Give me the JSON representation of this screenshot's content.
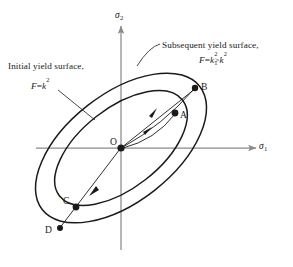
{
  "figure": {
    "background_color": "#ffffff",
    "line_color": "#1a1a1a",
    "axis_color": "#8a8a8a",
    "axes": {
      "vertical": {
        "name": "sigma-2",
        "base_symbol": "σ",
        "subscript": "2"
      },
      "horizontal": {
        "name": "sigma-1",
        "base_symbol": "σ",
        "subscript": "1"
      }
    },
    "annotations": {
      "initial": {
        "caption": "Initial yield surface,",
        "formula_lhs": "F",
        "formula_eq": "=",
        "formula_rhs_base": "k",
        "formula_rhs_sup": "2",
        "formula_plain": "F = k2"
      },
      "subsequent": {
        "caption": "Subsequent yield surface,",
        "formula_lhs": "F",
        "formula_eq": "=",
        "formula_rhs_base": "k",
        "formula_rhs_sup": "2",
        "formula_rhs_sub": "1",
        "formula_relation": ">",
        "formula_second_base": "k",
        "formula_second_sup": "2",
        "formula_plain": "F = k1^2 > k^2"
      }
    },
    "points": [
      {
        "name": "origin",
        "label": "O",
        "x": 121,
        "y": 148,
        "marked": true
      },
      {
        "name": "point-a",
        "label": "A",
        "x": 175,
        "y": 113,
        "marked": true
      },
      {
        "name": "point-b",
        "label": "B",
        "x": 195,
        "y": 88,
        "marked": true
      },
      {
        "name": "point-c",
        "label": "C",
        "x": 76,
        "y": 207,
        "marked": true
      },
      {
        "name": "point-d",
        "label": "D",
        "x": 60,
        "y": 228,
        "marked": true
      }
    ],
    "curves": [
      {
        "name": "initial-yield-surface",
        "type": "ellipse",
        "rx": 78,
        "ry": 40,
        "cx": 121,
        "cy": 148,
        "rotation_deg": -38
      },
      {
        "name": "subsequent-yield-surface",
        "type": "ellipse",
        "rx": 100,
        "ry": 54,
        "cx": 121,
        "cy": 148,
        "rotation_deg": -38
      }
    ],
    "paths": [
      {
        "name": "loading-path-upper",
        "from": "O",
        "to": "B",
        "arrow": true
      },
      {
        "name": "loading-path-lower",
        "from": "O",
        "to": "A",
        "arrow": true
      },
      {
        "name": "unloading-path",
        "from": "O",
        "to": "D",
        "arrow": true
      }
    ],
    "leaders": [
      {
        "name": "initial-surface-leader",
        "from_label": "F = k2",
        "to_curve": "initial-yield-surface"
      },
      {
        "name": "subsequent-surface-leader",
        "from_label": "Subsequent yield surface,",
        "to_curve": "subsequent-yield-surface"
      }
    ]
  }
}
